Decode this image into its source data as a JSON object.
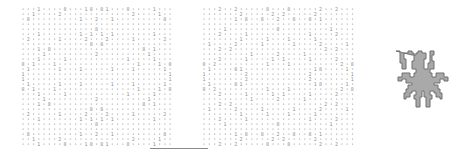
{
  "figure": {
    "panels": [
      {
        "id": "left-grid",
        "cols": 29,
        "rows": 28,
        "x": 22,
        "y": 8,
        "cell_w": 5.25,
        "cell_h": 5.0
      },
      {
        "id": "right-grid",
        "cols": 29,
        "rows": 28,
        "x": 203,
        "y": 8,
        "cell_w": 5.3,
        "cell_h": 5.0
      }
    ],
    "glyphs": [
      "·",
      "1",
      "2",
      "8"
    ],
    "colors": {
      "dot": "#b4b4b4",
      "glyph": "#8c8c8c",
      "spider_fill": "#a9a9a9",
      "spider_stroke": "#6e6e6e",
      "line": "#8a8a8a"
    },
    "shape": "spider-silhouette"
  }
}
